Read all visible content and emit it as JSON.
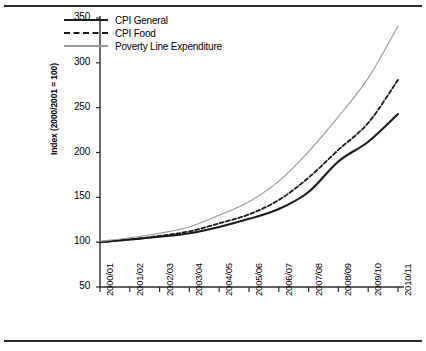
{
  "figure": {
    "has_top_rule": true,
    "has_bottom_rule": true
  },
  "legend": {
    "position": "top-left-inside",
    "entries": [
      {
        "label": "CPI General",
        "style": "solid",
        "color": "#1a1a1a"
      },
      {
        "label": "CPI Food",
        "style": "dashed",
        "color": "#1a1a1a"
      },
      {
        "label": "Poverty Line Expenditure",
        "style": "thin-solid",
        "color": "#9a9a9a"
      }
    ]
  },
  "chart_data": {
    "type": "line",
    "title": "",
    "xlabel": "",
    "ylabel": "Index (2000/2001 = 100)",
    "categories": [
      "2000/01",
      "2001/02",
      "2002/03",
      "2003/04",
      "2004/05",
      "2005/06",
      "2006/07",
      "2007/08",
      "2008/09",
      "2009/10",
      "2010/11"
    ],
    "ylim": [
      50,
      350
    ],
    "yticks": [
      50,
      100,
      150,
      200,
      250,
      300,
      350
    ],
    "grid": false,
    "series": [
      {
        "name": "CPI General",
        "color": "#1a1a1a",
        "style": "solid",
        "values": [
          100,
          103,
          106,
          110,
          117,
          126,
          137,
          156,
          190,
          212,
          243
        ]
      },
      {
        "name": "CPI Food",
        "color": "#1a1a1a",
        "style": "dashed",
        "values": [
          100,
          103,
          107,
          112,
          121,
          131,
          147,
          172,
          203,
          233,
          281
        ]
      },
      {
        "name": "Poverty Line Expenditure",
        "color": "#9a9a9a",
        "style": "thin-solid",
        "values": [
          101,
          105,
          110,
          117,
          130,
          145,
          168,
          201,
          240,
          283,
          341
        ]
      }
    ]
  }
}
